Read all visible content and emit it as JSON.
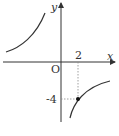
{
  "diagram": {
    "title": "",
    "function": "y = -8/x",
    "axes": {
      "x_label": "x",
      "y_label": "y",
      "origin_label": "O"
    },
    "marked_point": {
      "x": 2,
      "y": -4,
      "x_tick_label": "2",
      "y_tick_label": "-4"
    },
    "colors": {
      "curve": "#333333",
      "axis": "#333333",
      "guide": "#888888"
    }
  }
}
